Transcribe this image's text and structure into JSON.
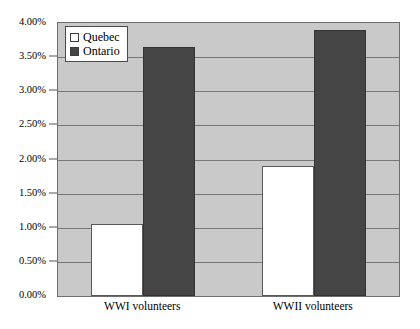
{
  "chart_data": {
    "type": "bar",
    "title": "",
    "subtitle": "",
    "xlabel": "",
    "ylabel": "",
    "categories": [
      "WWI volunteers",
      "WWII volunteers"
    ],
    "series": [
      {
        "name": "Quebec",
        "values": [
          1.05,
          1.9
        ],
        "color": "#ffffff"
      },
      {
        "name": "Ontario",
        "values": [
          3.65,
          3.9
        ],
        "color": "#454545"
      }
    ],
    "ylim": [
      0,
      4
    ],
    "ytick_step": 0.5,
    "ytick_labels": [
      "0.00%",
      "0.50%",
      "1.00%",
      "1.50%",
      "2.00%",
      "2.50%",
      "3.00%",
      "3.50%",
      "4.00%"
    ],
    "ytick_values": [
      0,
      0.5,
      1,
      1.5,
      2,
      2.5,
      3,
      3.5,
      4
    ],
    "value_unit": "%",
    "grid": true,
    "grid_axis": "y",
    "legend_position": "top-left-inside",
    "plot_background": "#c9c9c9",
    "page_background": "#ffffff",
    "grid_color": "#777777",
    "axis_color": "#6e6e6e"
  },
  "legend": {
    "entries": [
      {
        "label": "Quebec",
        "swatch": "quebec"
      },
      {
        "label": "Ontario",
        "swatch": "ontario"
      }
    ]
  }
}
